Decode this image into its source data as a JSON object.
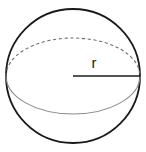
{
  "figure": {
    "name": "sphere-with-radius",
    "background_color": "#ffffff",
    "width": 146,
    "height": 152
  },
  "geometry": {
    "sphere": {
      "center_x": 73,
      "center_y": 76,
      "radius": 67,
      "stroke_color": "#1a1a1a",
      "stroke_width": 1.8
    },
    "equator": {
      "center_x": 73,
      "center_y": 76,
      "radius_x": 67,
      "radius_y": 38,
      "back_half_style": "dashed",
      "back_half_color": "#6d6d6d",
      "back_half_stroke_width": 1.1,
      "back_half_dash_pattern": "3.2 2.6",
      "front_half_style": "solid",
      "front_half_color": "#8a8a8a",
      "front_half_stroke_width": 1.1
    },
    "radius_line": {
      "x1": 73,
      "y1": 76,
      "x2": 140,
      "y2": 76,
      "stroke_color": "#1a1a1a",
      "stroke_width": 1.6
    }
  },
  "labels": {
    "radius": {
      "text": "r",
      "x": 94,
      "y": 68,
      "font_size": 15,
      "color": "#1a1a1a"
    }
  }
}
